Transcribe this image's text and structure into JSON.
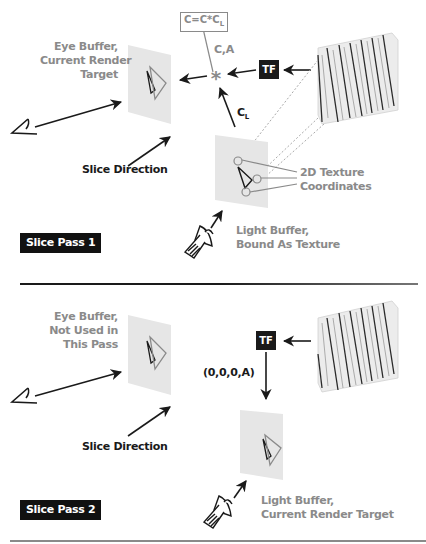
{
  "figure": {
    "panels": [
      {
        "id": "pass1",
        "pass_label": "Slice Pass 1",
        "eye_buffer_label": [
          "Eye Buffer,",
          "Current Render",
          "Target"
        ],
        "slice_direction_label": "Slice Direction",
        "light_buffer_label": [
          "Light Buffer,",
          "Bound As Texture"
        ],
        "texcoord_label": [
          "2D Texture",
          "Coordinates"
        ],
        "tf_label": "TF",
        "blend_equation": "C=C*C",
        "blend_equation_sub": "L",
        "color_alpha_label": "C,A",
        "light_color_label": "C",
        "light_color_sub": "L",
        "operator_symbol": "*"
      },
      {
        "id": "pass2",
        "pass_label": "Slice Pass 2",
        "eye_buffer_label": [
          "Eye Buffer,",
          "Not Used in",
          "This Pass"
        ],
        "slice_direction_label": "Slice Direction",
        "light_buffer_label": [
          "Light Buffer,",
          "Current Render Target"
        ],
        "tf_label": "TF",
        "output_value_label": "(0,0,0,A)"
      }
    ],
    "icons": [
      "eye-icon",
      "spotlight-icon",
      "volume-slices-icon",
      "triangle-icon"
    ],
    "colors": {
      "dark": "#1a1a1a",
      "label_gray": "#8a8a8a",
      "plane_fill": "#e6e6e6",
      "volume_fill": "#ececec"
    }
  }
}
